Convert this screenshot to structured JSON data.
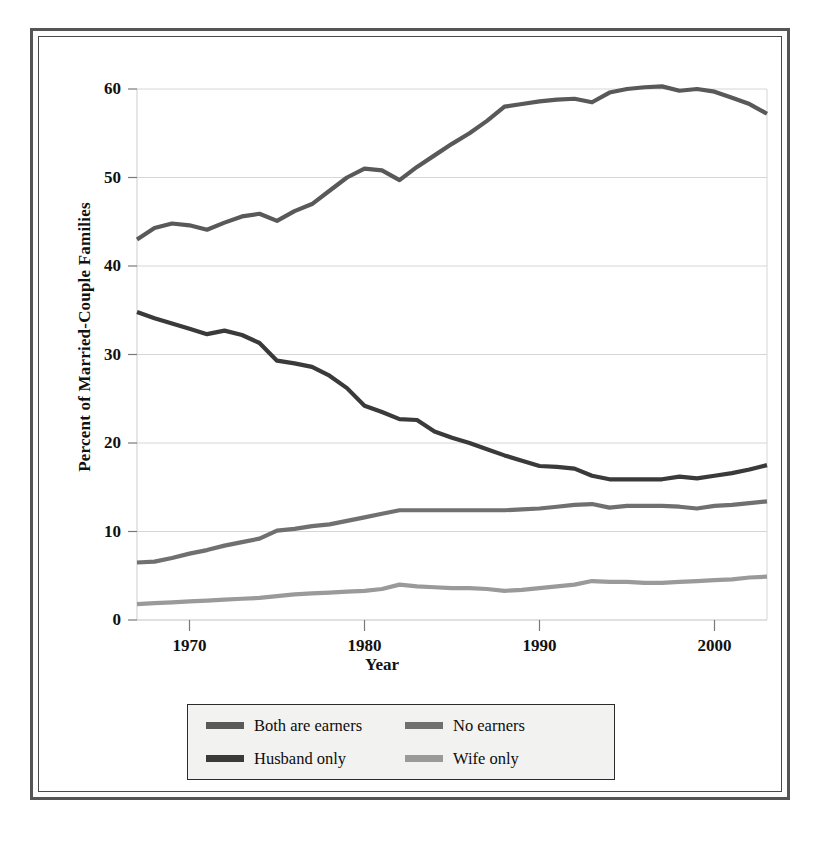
{
  "chart_data": {
    "type": "line",
    "title": "",
    "xlabel": "Year",
    "ylabel": "Percent of Married-Couple Families",
    "xlim": [
      1967,
      2003
    ],
    "ylim": [
      0,
      60
    ],
    "grid": true,
    "legend_position": "bottom",
    "x_ticks": [
      "1970",
      "1980",
      "1990",
      "2000"
    ],
    "x_tick_values": [
      1970,
      1980,
      1990,
      2000
    ],
    "y_ticks": [
      "0",
      "10",
      "20",
      "30",
      "40",
      "50",
      "60"
    ],
    "y_tick_values": [
      0,
      10,
      20,
      30,
      40,
      50,
      60
    ],
    "x": [
      1967,
      1968,
      1969,
      1970,
      1971,
      1972,
      1973,
      1974,
      1975,
      1976,
      1977,
      1978,
      1979,
      1980,
      1981,
      1982,
      1983,
      1984,
      1985,
      1986,
      1987,
      1988,
      1989,
      1990,
      1991,
      1992,
      1993,
      1994,
      1995,
      1996,
      1997,
      1998,
      1999,
      2000,
      2001,
      2002,
      2003
    ],
    "series": [
      {
        "name": "Both are earners",
        "color": "#595959",
        "values": [
          43.0,
          44.3,
          44.8,
          44.6,
          44.1,
          44.9,
          45.6,
          45.9,
          45.1,
          46.2,
          47.0,
          48.5,
          50.0,
          51.0,
          50.8,
          49.7,
          51.2,
          52.5,
          53.8,
          55.0,
          56.4,
          58.0,
          58.3,
          58.6,
          58.8,
          58.9,
          58.5,
          59.6,
          60.0,
          60.2,
          60.3,
          59.8,
          60.0,
          59.7,
          59.0,
          58.3,
          57.2
        ]
      },
      {
        "name": "Husband only",
        "color": "#3a3a3a",
        "values": [
          34.8,
          34.1,
          33.5,
          32.9,
          32.3,
          32.7,
          32.2,
          31.3,
          29.3,
          29.0,
          28.6,
          27.6,
          26.2,
          24.2,
          23.5,
          22.7,
          22.6,
          21.3,
          20.6,
          20.0,
          19.3,
          18.6,
          18.0,
          17.4,
          17.3,
          17.1,
          16.3,
          15.9,
          15.9,
          15.9,
          15.9,
          16.2,
          16.0,
          16.3,
          16.6,
          17.0,
          17.5
        ]
      },
      {
        "name": "No earners",
        "color": "#707070",
        "values": [
          6.5,
          6.6,
          7.0,
          7.5,
          7.9,
          8.4,
          8.8,
          9.2,
          10.1,
          10.3,
          10.6,
          10.8,
          11.2,
          11.6,
          12.0,
          12.4,
          12.4,
          12.4,
          12.4,
          12.4,
          12.4,
          12.4,
          12.5,
          12.6,
          12.8,
          13.0,
          13.1,
          12.7,
          12.9,
          12.9,
          12.9,
          12.8,
          12.6,
          12.9,
          13.0,
          13.2,
          13.4
        ]
      },
      {
        "name": "Wife only",
        "color": "#9a9a9a",
        "values": [
          1.8,
          1.9,
          2.0,
          2.1,
          2.2,
          2.3,
          2.4,
          2.5,
          2.7,
          2.9,
          3.0,
          3.1,
          3.2,
          3.3,
          3.5,
          4.0,
          3.8,
          3.7,
          3.6,
          3.6,
          3.5,
          3.3,
          3.4,
          3.6,
          3.8,
          4.0,
          4.4,
          4.3,
          4.3,
          4.2,
          4.2,
          4.3,
          4.4,
          4.5,
          4.6,
          4.8,
          4.9
        ]
      }
    ]
  },
  "axis": {
    "y_title": "Percent of Married-Couple Families",
    "x_title": "Year",
    "y_labels": [
      "60",
      "50",
      "40",
      "30",
      "20",
      "10",
      "0"
    ],
    "x_labels": [
      "1970",
      "1980",
      "1990",
      "2000"
    ]
  },
  "legend": {
    "items": [
      {
        "label": "Both are earners",
        "color": "#595959"
      },
      {
        "label": "No earners",
        "color": "#707070"
      },
      {
        "label": "Husband only",
        "color": "#3a3a3a"
      },
      {
        "label": "Wife only",
        "color": "#9a9a9a"
      }
    ]
  },
  "colors": {
    "grid": "#d6d6d6",
    "axis": "#7a7a7a",
    "frame_outer": "#555555",
    "frame_inner": "#4a4a4a",
    "legend_bg": "#f2f2f0",
    "text": "#111111"
  }
}
